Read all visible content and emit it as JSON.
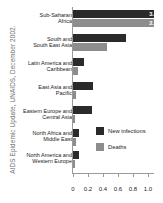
{
  "caption": "AIDS Epidemic Update, UNAIDS, December 2002.",
  "chart_data": {
    "type": "bar",
    "orientation": "horizontal",
    "title": "",
    "xlabel": "",
    "ylabel": "",
    "xlim": [
      0,
      1.08
    ],
    "xticks": [
      0,
      0.2,
      0.4,
      0.6,
      0.8,
      1.0
    ],
    "xticklabels": [
      "0",
      "0.2",
      "0.4",
      "0.6",
      "0.8",
      "1.0"
    ],
    "grid": false,
    "legend_position": "center-right",
    "categories": [
      "Sub-Saharan\nAfrica",
      "South and\nSouth East Asia",
      "Latin America and\nCaribbean",
      "East Asia and\nPacific",
      "Eastern Europe and\nCentral Asia",
      "North Africa and\nMiddle East",
      "North America and\nWestern Europe"
    ],
    "series": [
      {
        "name": "New infections",
        "color": "#2b2b2b",
        "values": [
          3.2,
          0.7,
          0.15,
          0.27,
          0.25,
          0.083,
          0.08
        ],
        "value_labels": [
          "3.2",
          "",
          "",
          "",
          "",
          "",
          ""
        ]
      },
      {
        "name": "Deaths",
        "color": "#8d8d8d",
        "values": [
          2.3,
          0.45,
          0.06,
          0.045,
          0.025,
          0.037,
          0.03
        ],
        "value_labels": [
          "2.3",
          "",
          "",
          "",
          "",
          "",
          ""
        ]
      }
    ]
  }
}
